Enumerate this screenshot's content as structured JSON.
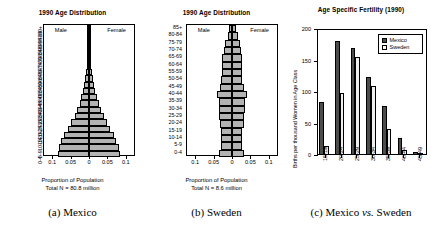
{
  "figure": {
    "panels": [
      {
        "id": "mexico",
        "title": "1990 Age Distribution",
        "male_label": "Male",
        "female_label": "Female",
        "xlabel_line1": "Proportion of Population",
        "xlabel_line2": "Total N = 80.8 million",
        "caption_prefix": "(a)",
        "caption_text": "Mexico"
      },
      {
        "id": "sweden",
        "title": "1990 Age Distribution",
        "male_label": "Male",
        "female_label": "Female",
        "xlabel_line1": "Proportion of Population",
        "xlabel_line2": "Total N = 8.6 million",
        "caption_prefix": "(b)",
        "caption_text": "Sweden"
      },
      {
        "id": "fertility",
        "caption_prefix": "(c)",
        "caption_text": "Mexico",
        "caption_italic": "vs.",
        "caption_text2": "Sweden"
      }
    ]
  },
  "chart_data": [
    {
      "type": "bar",
      "id": "mexico-pyramid",
      "title": "1990 Age Distribution",
      "subtitle": "Total N = 80.8 million",
      "orientation": "horizontal-population-pyramid",
      "xlabel": "Proportion of Population",
      "ylabel": "",
      "xlim": [
        -0.125,
        0.125
      ],
      "xticks": [
        -0.1,
        -0.05,
        0,
        0.05,
        0.1
      ],
      "xticklabels": [
        "0.1",
        "0.05",
        "0",
        "0.05",
        "0.1"
      ],
      "grid": false,
      "legend_position": "in-plot-top",
      "categories": [
        "0-4",
        "5-9",
        "10-14",
        "15-19",
        "20-24",
        "25-29",
        "30-34",
        "35-39",
        "40-44",
        "45-49",
        "50-54",
        "55-59",
        "60-64",
        "65-69",
        "70-74",
        "75-79",
        "80-84",
        "85-89",
        "90-94",
        "95-99",
        "100+"
      ],
      "series": [
        {
          "name": "Male",
          "values": [
            0.0875,
            0.0845,
            0.0775,
            0.07,
            0.059,
            0.049,
            0.0395,
            0.032,
            0.0262,
            0.0212,
            0.017,
            0.0135,
            0.0105,
            0.0078,
            0.0055,
            0.0036,
            0.0021,
            0.0011,
            0.0005,
            0.0002,
            0.0001
          ]
        },
        {
          "name": "Female",
          "values": [
            0.086,
            0.083,
            0.076,
            0.069,
            0.0595,
            0.05,
            0.0405,
            0.0328,
            0.0268,
            0.0218,
            0.0176,
            0.0141,
            0.011,
            0.0083,
            0.0059,
            0.004,
            0.0024,
            0.0013,
            0.0006,
            0.0002,
            0.0001
          ]
        }
      ]
    },
    {
      "type": "bar",
      "id": "sweden-pyramid",
      "title": "1990 Age Distribution",
      "subtitle": "Total N = 8.6 million",
      "orientation": "horizontal-population-pyramid",
      "xlabel": "Proportion of Population",
      "ylabel": "",
      "xlim": [
        -0.125,
        0.125
      ],
      "xticks": [
        -0.1,
        -0.05,
        0,
        0.05,
        0.1
      ],
      "xticklabels": [
        "0.1",
        "0.05",
        "0",
        "0.05",
        "0.1"
      ],
      "grid": false,
      "legend_position": "in-plot-top",
      "categories": [
        "0-4",
        "5-9",
        "10-14",
        "15-19",
        "20-24",
        "25-29",
        "30-34",
        "35-39",
        "40-44",
        "45-49",
        "50-54",
        "55-59",
        "60-64",
        "65-69",
        "70-74",
        "75-79",
        "80-84",
        "85+"
      ],
      "series": [
        {
          "name": "Male",
          "values": [
            0.035,
            0.0305,
            0.03,
            0.03,
            0.034,
            0.035,
            0.0365,
            0.037,
            0.043,
            0.033,
            0.0295,
            0.027,
            0.029,
            0.0275,
            0.023,
            0.0185,
            0.012,
            0.007
          ]
        },
        {
          "name": "Female",
          "values": [
            0.0332,
            0.029,
            0.0285,
            0.0285,
            0.0322,
            0.0335,
            0.035,
            0.0355,
            0.0412,
            0.032,
            0.0288,
            0.0265,
            0.029,
            0.0285,
            0.025,
            0.0215,
            0.0155,
            0.0105
          ]
        }
      ]
    },
    {
      "type": "bar",
      "id": "age-specific-fertility",
      "title": "Age Specific Fertility (1990)",
      "xlabel": "",
      "ylabel": "Births per thousand Women in Age Class",
      "ylim": [
        0,
        200
      ],
      "yticks": [
        0,
        50,
        100,
        150,
        200
      ],
      "yticklabels": [
        "0",
        "50",
        "100",
        "150",
        "200"
      ],
      "grid": false,
      "legend_position": "upper-right",
      "categories": [
        "15-19",
        "20-24",
        "25-29",
        "30-34",
        "35-39",
        "40-44",
        "45-49"
      ],
      "series": [
        {
          "name": "Mexico",
          "values": [
            84,
            181,
            170,
            124,
            78,
            27,
            5
          ]
        },
        {
          "name": "Sweden",
          "values": [
            14,
            99,
            155,
            110,
            42,
            8,
            0.5
          ]
        }
      ]
    }
  ],
  "colors": {
    "pyramid_bar": "#b3b3b3",
    "mexico_bar": "#4d4d4d",
    "sweden_bar": "#efefef",
    "axis": "#000000",
    "background": "#ffffff"
  }
}
